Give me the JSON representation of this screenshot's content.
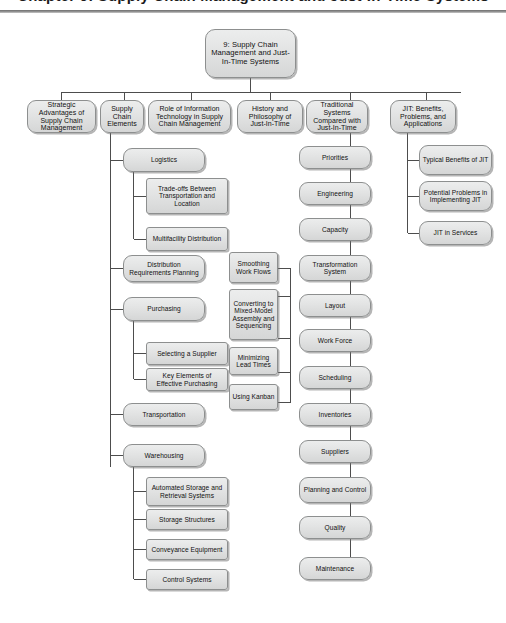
{
  "page": {
    "title": "Chapter 9: Supply Chain Management and Just-In-Time Systems",
    "background": "#ffffff",
    "node_fill": "#e3e4e4",
    "node_border": "#8d8f8f",
    "line_color": "#4d4d4d"
  },
  "diagram": {
    "type": "hierarchy-tree",
    "root": {
      "label": "9: Supply Chain Management and Just-In-Time Systems"
    },
    "level1": [
      {
        "label": "Strategic Advantages of Supply Chain Management"
      },
      {
        "label": "Supply Chain Elements"
      },
      {
        "label": "Role of Information Technology in Supply Chain Management"
      },
      {
        "label": "History and Philosophy of Just-In-Time"
      },
      {
        "label": "Traditional Systems Compared with Just-In-Time"
      },
      {
        "label": "JIT: Benefits, Problems, and Applications"
      }
    ],
    "supply_chain_elements": [
      {
        "label": "Logistics"
      },
      {
        "label": "Trade-offs Between Transportation and Location"
      },
      {
        "label": "Multifacility Distribution"
      },
      {
        "label": "Distribution Requirements Planning"
      },
      {
        "label": "Purchasing"
      },
      {
        "label": "Selecting a Supplier"
      },
      {
        "label": "Key Elements of Effective Purchasing"
      },
      {
        "label": "Transportation"
      },
      {
        "label": "Warehousing"
      },
      {
        "label": "Automated Storage and Retrieval Systems"
      },
      {
        "label": "Storage Structures"
      },
      {
        "label": "Conveyance Equipment"
      },
      {
        "label": "Control Systems"
      }
    ],
    "traditional_systems": [
      {
        "label": "Priorities"
      },
      {
        "label": "Engineering"
      },
      {
        "label": "Capacity"
      },
      {
        "label": "Transformation System"
      },
      {
        "label": "Layout"
      },
      {
        "label": "Work Force"
      },
      {
        "label": "Scheduling"
      },
      {
        "label": "Inventories"
      },
      {
        "label": "Suppliers"
      },
      {
        "label": "Planning and Control"
      },
      {
        "label": "Quality"
      },
      {
        "label": "Maintenance"
      }
    ],
    "transformation_system_children": [
      {
        "label": "Smoothing Work Flows"
      },
      {
        "label": "Converting to Mixed-Model Assembly and Sequencing"
      },
      {
        "label": "Minimizing Lead Times"
      },
      {
        "label": "Using Kanban"
      }
    ],
    "jit_children": [
      {
        "label": "Typical Benefits of JIT"
      },
      {
        "label": "Potential Problems in Implementing JIT"
      },
      {
        "label": "JIT in Services"
      }
    ]
  }
}
